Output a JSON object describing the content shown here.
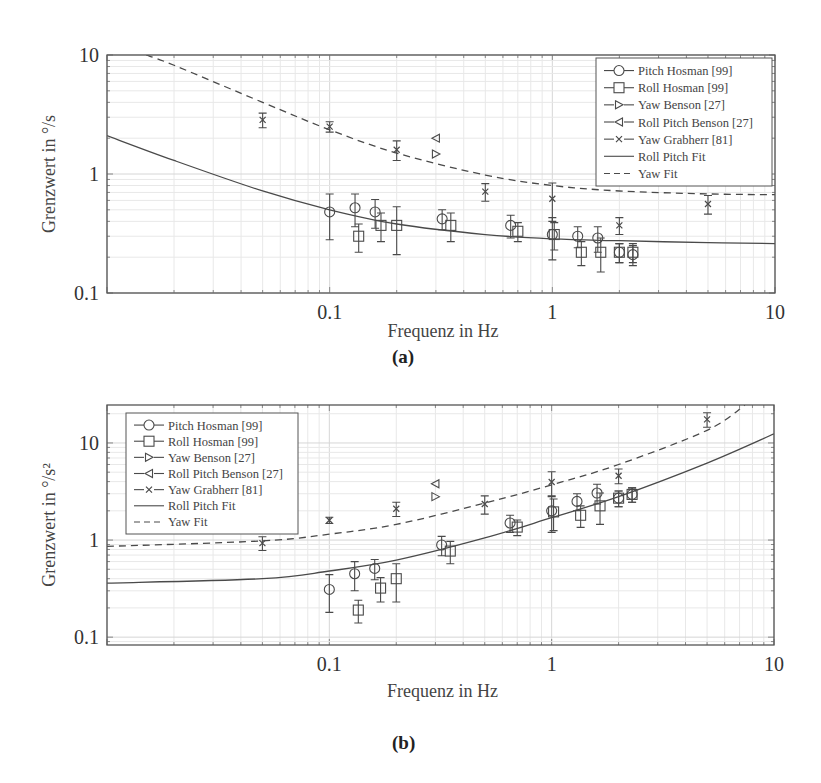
{
  "figures": [
    {
      "caption": "(a)",
      "xlabel": "Frequenz in Hz",
      "ylabel": "Grenzwert in °/s",
      "ylabel_main": "Grenzwert in ",
      "ylabel_unit": "°/s",
      "x_ticks": [
        "0.1",
        "1",
        "10"
      ],
      "y_ticks": [
        "0.1",
        "1",
        "10"
      ],
      "legend": [
        "Pitch Hosman [99]",
        "Roll Hosman [99]",
        "Yaw Benson [27]",
        "Roll Pitch Benson [27]",
        "Yaw Grabherr [81]",
        "Roll Pitch Fit",
        "Yaw Fit"
      ]
    },
    {
      "caption": "(b)",
      "xlabel": "Frequenz in Hz",
      "ylabel": "Grenzwert in °/s²",
      "ylabel_main": "Grenzwert in ",
      "ylabel_unit": "°/s²",
      "x_ticks": [
        "0.1",
        "1",
        "10"
      ],
      "y_ticks": [
        "0.1",
        "1",
        "10"
      ],
      "legend": [
        "Pitch Hosman [99]",
        "Roll Hosman [99]",
        "Yaw Benson [27]",
        "Roll Pitch Benson [27]",
        "Yaw Grabherr [81]",
        "Roll Pitch Fit",
        "Yaw Fit"
      ]
    }
  ],
  "chart_data": [
    {
      "type": "scatter",
      "title": "(a)",
      "xlabel": "Frequenz in Hz",
      "ylabel": "Grenzwert in °/s",
      "xscale": "log",
      "yscale": "log",
      "xlim": [
        0.01,
        10
      ],
      "ylim": [
        0.1,
        10
      ],
      "grid": true,
      "legend_position": "upper right",
      "series": [
        {
          "name": "Pitch Hosman [99]",
          "marker": "circle",
          "x": [
            0.1,
            0.13,
            0.16,
            0.32,
            0.65,
            1.0,
            1.3,
            1.6,
            2.0,
            2.3
          ],
          "y": [
            0.48,
            0.52,
            0.48,
            0.42,
            0.37,
            0.31,
            0.3,
            0.29,
            0.22,
            0.21
          ],
          "err": [
            0.2,
            0.16,
            0.13,
            0.08,
            0.08,
            0.12,
            0.06,
            0.07,
            0.04,
            0.04
          ]
        },
        {
          "name": "Roll Hosman [99]",
          "marker": "square",
          "x": [
            0.135,
            0.17,
            0.2,
            0.35,
            0.7,
            1.02,
            1.35,
            1.65,
            2.0,
            2.3
          ],
          "y": [
            0.3,
            0.37,
            0.37,
            0.37,
            0.33,
            0.31,
            0.22,
            0.22,
            0.22,
            0.22
          ],
          "err": [
            0.08,
            0.1,
            0.16,
            0.1,
            0.06,
            0.08,
            0.05,
            0.07,
            0.04,
            0.04
          ]
        },
        {
          "name": "Yaw Benson [27]",
          "marker": "triangle-right",
          "x": [
            0.3
          ],
          "y": [
            1.47
          ],
          "err": [
            0
          ]
        },
        {
          "name": "Roll Pitch Benson [27]",
          "marker": "triangle-left",
          "x": [
            0.3
          ],
          "y": [
            2.0
          ],
          "err": [
            0
          ]
        },
        {
          "name": "Yaw Grabherr [81]",
          "marker": "x",
          "x": [
            0.05,
            0.1,
            0.2,
            0.5,
            1.0,
            2.0,
            5.0
          ],
          "y": [
            2.85,
            2.5,
            1.6,
            0.71,
            0.62,
            0.37,
            0.56
          ],
          "err": [
            0.4,
            0.25,
            0.3,
            0.12,
            0.22,
            0.06,
            0.1
          ]
        },
        {
          "name": "Roll Pitch Fit",
          "line": "solid",
          "x": [
            0.01,
            0.02,
            0.05,
            0.1,
            0.2,
            0.5,
            1,
            2,
            5,
            10
          ],
          "y": [
            2.1,
            1.3,
            0.72,
            0.5,
            0.38,
            0.31,
            0.285,
            0.275,
            0.265,
            0.26
          ]
        },
        {
          "name": "Yaw Fit",
          "line": "dashed",
          "x": [
            0.015,
            0.02,
            0.05,
            0.1,
            0.2,
            0.5,
            1,
            2,
            5,
            10
          ],
          "y": [
            10,
            8.2,
            4.0,
            2.35,
            1.5,
            0.98,
            0.8,
            0.72,
            0.68,
            0.67
          ]
        }
      ]
    },
    {
      "type": "scatter",
      "title": "(b)",
      "xlabel": "Frequenz in Hz",
      "ylabel": "Grenzwert in °/s²",
      "xscale": "log",
      "yscale": "log",
      "xlim": [
        0.01,
        10
      ],
      "ylim": [
        0.083,
        24.6
      ],
      "grid": true,
      "legend_position": "upper left",
      "series": [
        {
          "name": "Pitch Hosman [99]",
          "marker": "circle",
          "x": [
            0.1,
            0.13,
            0.16,
            0.32,
            0.65,
            1.0,
            1.3,
            1.6,
            2.0,
            2.3
          ],
          "y": [
            0.31,
            0.45,
            0.51,
            0.89,
            1.5,
            2.0,
            2.5,
            3.05,
            2.7,
            2.95
          ],
          "err": [
            0.13,
            0.15,
            0.12,
            0.2,
            0.3,
            0.8,
            0.5,
            0.7,
            0.5,
            0.5
          ]
        },
        {
          "name": "Roll Hosman [99]",
          "marker": "square",
          "x": [
            0.135,
            0.17,
            0.2,
            0.35,
            0.7,
            1.02,
            1.35,
            1.65,
            2.0,
            2.3
          ],
          "y": [
            0.19,
            0.32,
            0.4,
            0.77,
            1.36,
            1.95,
            1.8,
            2.25,
            2.7,
            2.95
          ],
          "err": [
            0.05,
            0.09,
            0.17,
            0.2,
            0.25,
            0.7,
            0.45,
            0.8,
            0.5,
            0.5
          ]
        },
        {
          "name": "Yaw Benson [27]",
          "marker": "triangle-right",
          "x": [
            0.3
          ],
          "y": [
            2.8
          ],
          "err": [
            0
          ]
        },
        {
          "name": "Roll Pitch Benson [27]",
          "marker": "triangle-left",
          "x": [
            0.3
          ],
          "y": [
            3.8
          ],
          "err": [
            0
          ]
        },
        {
          "name": "Yaw Grabherr [81]",
          "marker": "x",
          "x": [
            0.05,
            0.1,
            0.2,
            0.5,
            1.0,
            2.0,
            5.0
          ],
          "y": [
            0.93,
            1.6,
            2.1,
            2.35,
            3.96,
            4.6,
            17.5
          ],
          "err": [
            0.15,
            0.12,
            0.35,
            0.5,
            1.1,
            0.8,
            3.0
          ]
        },
        {
          "name": "Roll Pitch Fit",
          "line": "solid",
          "x": [
            0.01,
            0.05,
            0.1,
            0.2,
            0.5,
            1,
            2,
            5,
            10
          ],
          "y": [
            0.36,
            0.4,
            0.48,
            0.62,
            1.05,
            1.7,
            2.8,
            6.2,
            12.4
          ]
        },
        {
          "name": "Yaw Fit",
          "line": "dashed",
          "x": [
            0.01,
            0.05,
            0.1,
            0.2,
            0.5,
            1,
            2,
            5,
            7.4
          ],
          "y": [
            0.86,
            0.98,
            1.15,
            1.45,
            2.4,
            3.7,
            6.0,
            13.5,
            24.6
          ]
        }
      ]
    }
  ]
}
